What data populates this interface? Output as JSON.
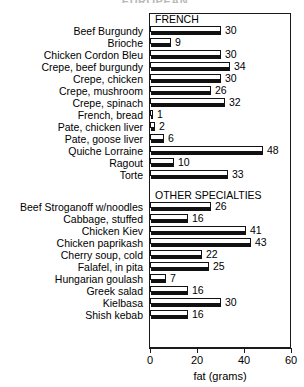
{
  "clipped_title": "EUROPEAN",
  "chart_data": {
    "type": "bar",
    "orientation": "horizontal",
    "title": "",
    "xlabel": "fat (grams)",
    "ylabel": "",
    "xlim": [
      0,
      60
    ],
    "xticks": [
      0,
      20,
      40,
      60
    ],
    "xtick_labels": [
      "0",
      "20",
      "40",
      "60"
    ],
    "grid": false,
    "legend": false,
    "sections": [
      {
        "header": "FRENCH",
        "categories": [
          "Beef Burgundy",
          "Brioche",
          "Chicken Cordon Bleu",
          "Crepe, beef burgundy",
          "Crepe, chicken",
          "Crepe, mushroom",
          "Crepe, spinach",
          "French, bread",
          "Pate, chicken liver",
          "Pate, goose liver",
          "Quiche Lorraine",
          "Ragout",
          "Torte"
        ],
        "values": [
          30,
          9,
          30,
          34,
          30,
          26,
          32,
          1,
          2,
          6,
          48,
          10,
          33
        ]
      },
      {
        "header": "OTHER SPECIALTIES",
        "categories": [
          "Beef Stroganoff w/noodles",
          "Cabbage, stuffed",
          "Chicken Kiev",
          "Chicken paprikash",
          "Cherry soup, cold",
          "Falafel, in pita",
          "Hungarian goulash",
          "Greek salad",
          "Kielbasa",
          "Shish kebab"
        ],
        "values": [
          26,
          16,
          41,
          43,
          22,
          25,
          7,
          16,
          30,
          16
        ]
      }
    ]
  },
  "colors": {
    "bar_outline": "#111111",
    "bar_fill": "#ffffff",
    "bar_shadow": "#111111",
    "axis": "#1a1a1a",
    "text": "#000000",
    "background": "#ffffff"
  }
}
